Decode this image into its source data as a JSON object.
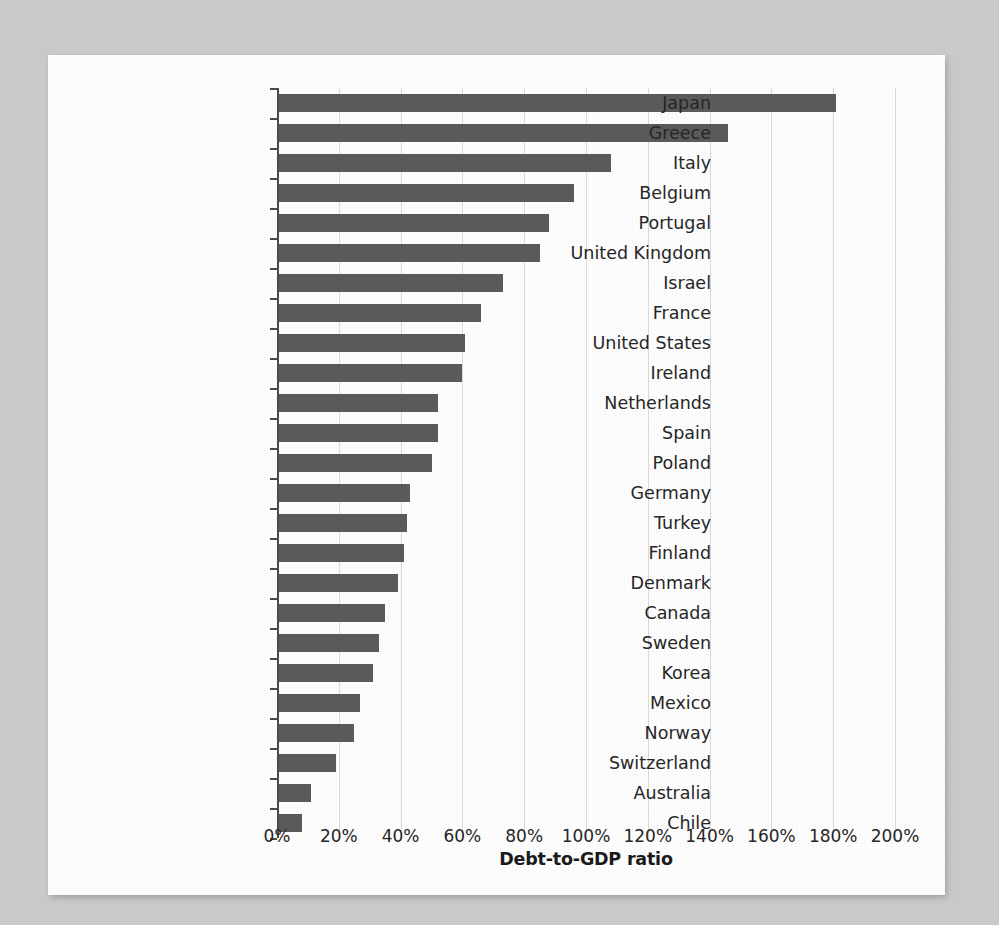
{
  "chart_data": {
    "type": "bar",
    "orientation": "horizontal",
    "title": "",
    "xlabel": "Debt-to-GDP ratio",
    "ylabel": "",
    "xlim": [
      0,
      200
    ],
    "xunit": "%",
    "grid": true,
    "legend": false,
    "bar_color": "#5a5a5a",
    "xticks": [
      "0%",
      "20%",
      "40%",
      "60%",
      "80%",
      "100%",
      "120%",
      "140%",
      "160%",
      "180%",
      "200%"
    ],
    "xtick_values": [
      0,
      20,
      40,
      60,
      80,
      100,
      120,
      140,
      160,
      180,
      200
    ],
    "categories": [
      "Japan",
      "Greece",
      "Italy",
      "Belgium",
      "Portugal",
      "United Kingdom",
      "Israel",
      "France",
      "United States",
      "Ireland",
      "Netherlands",
      "Spain",
      "Poland",
      "Germany",
      "Turkey",
      "Finland",
      "Denmark",
      "Canada",
      "Sweden",
      "Korea",
      "Mexico",
      "Norway",
      "Switzerland",
      "Australia",
      "Chile"
    ],
    "values": [
      181,
      146,
      108,
      96,
      88,
      85,
      73,
      66,
      61,
      60,
      52,
      52,
      50,
      43,
      42,
      41,
      39,
      35,
      33,
      31,
      27,
      25,
      19,
      11,
      8
    ]
  },
  "figure": {
    "page_background": "#c9c9c9",
    "sheet_background": "#fdfdfd"
  }
}
